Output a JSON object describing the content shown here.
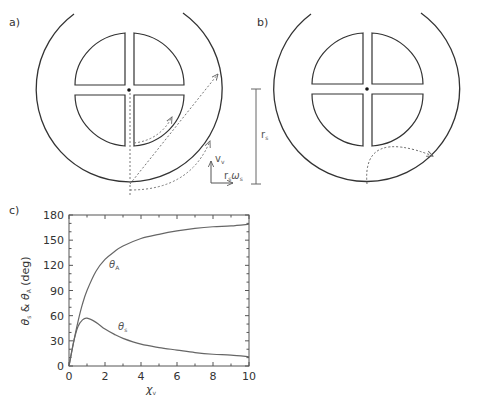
{
  "figure": {
    "panels": [
      {
        "id": "a",
        "label": "a)",
        "annotations": {
          "vertical_velocity": "v",
          "vertical_velocity_sub": "v",
          "rotational_velocity": "r",
          "rotational_velocity_sub1": "s",
          "rotational_velocity_omega": "ω",
          "rotational_velocity_sub2": "s"
        }
      },
      {
        "id": "b",
        "label": "b)",
        "annotations": {
          "radius_label": "r",
          "radius_sub": "s"
        }
      },
      {
        "id": "c",
        "label": "c)"
      }
    ],
    "colors": {
      "ink": "#333333",
      "dotted": "#666666",
      "curve": "#666666",
      "axis": "#555555"
    }
  },
  "chart_data": {
    "type": "line",
    "title": "",
    "xlabel": "χ",
    "xlabel_sub": "v",
    "ylabel_parts": [
      "θ",
      "s",
      " & ",
      "θ",
      "A",
      " (deg)"
    ],
    "xlim": [
      0,
      10
    ],
    "ylim": [
      0,
      180
    ],
    "xticks": [
      0,
      2,
      4,
      6,
      8,
      10
    ],
    "yticks": [
      0,
      30,
      60,
      90,
      120,
      150,
      180
    ],
    "grid": false,
    "legend": "none (inline curve labels)",
    "series": [
      {
        "name": "θA",
        "label_main": "θ",
        "label_sub": "A",
        "x": [
          0,
          0.25,
          0.5,
          0.75,
          1,
          1.5,
          2,
          2.5,
          3,
          4,
          5,
          6,
          7,
          8,
          9,
          10
        ],
        "values": [
          0,
          28,
          53,
          74,
          90,
          113,
          127,
          136,
          143,
          152,
          157,
          161,
          164,
          166,
          167,
          169
        ]
      },
      {
        "name": "θs",
        "label_main": "θ",
        "label_sub": "s",
        "x": [
          0,
          0.25,
          0.5,
          0.75,
          1,
          1.5,
          2,
          2.5,
          3,
          4,
          5,
          6,
          7,
          8,
          9,
          10
        ],
        "values": [
          0,
          28,
          47,
          55,
          57,
          52,
          44,
          38,
          33,
          26,
          22,
          19,
          16,
          14,
          13,
          11
        ]
      }
    ]
  }
}
